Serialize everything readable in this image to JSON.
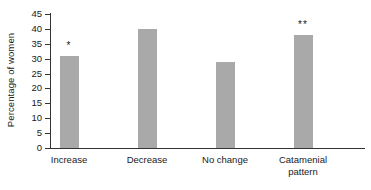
{
  "chart_data": {
    "type": "bar",
    "title": "",
    "xlabel": "",
    "ylabel": "Percentage of women",
    "ylim": [
      0,
      45
    ],
    "yticks": [
      0,
      5,
      10,
      15,
      20,
      25,
      30,
      35,
      40,
      45
    ],
    "ytick_labels": [
      "0",
      "5",
      "10",
      "15",
      "20",
      "25",
      "30",
      "35",
      "40",
      "45"
    ],
    "grid": false,
    "legend": null,
    "categories": [
      "Increase",
      "Decrease",
      "No change",
      "Catamenial pattern"
    ],
    "category_lines": [
      [
        "Increase"
      ],
      [
        "Decrease"
      ],
      [
        "No change"
      ],
      [
        "Catamenial",
        "pattern"
      ]
    ],
    "values": [
      31,
      40,
      29,
      38
    ],
    "annotations": [
      "*",
      "",
      "",
      "**"
    ],
    "bar_color": "#a9a9a9",
    "axis_color": "#333333"
  }
}
